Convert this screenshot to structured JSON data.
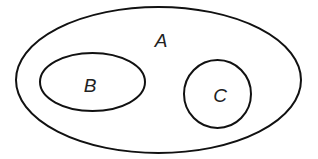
{
  "diagram": {
    "type": "venn",
    "colors": {
      "background": "#ffffff",
      "stroke": "#111111",
      "text": "#222222"
    },
    "sets": [
      {
        "id": "A",
        "label": "A",
        "shape": "ellipse",
        "cx": 158.5,
        "cy": 80,
        "rx": 142.5,
        "ry": 73,
        "label_x": 161,
        "label_y": 40
      },
      {
        "id": "B",
        "label": "B",
        "shape": "ellipse",
        "cx": 92.5,
        "cy": 82,
        "rx": 52.5,
        "ry": 29,
        "label_x": 90,
        "label_y": 85
      },
      {
        "id": "C",
        "label": "C",
        "shape": "ellipse",
        "cx": 217.5,
        "cy": 94,
        "rx": 33.5,
        "ry": 34,
        "label_x": 220,
        "label_y": 95
      }
    ],
    "relations": [
      "B ⊂ A",
      "C ⊂ A",
      "B ∩ C = ∅"
    ]
  }
}
